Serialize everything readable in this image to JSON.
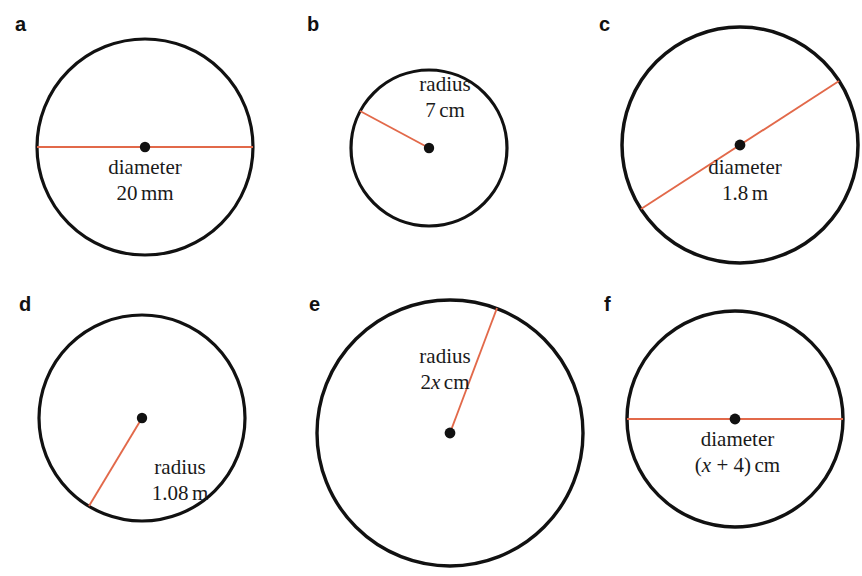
{
  "figure": {
    "background_color": "#ffffff",
    "outline_color": "#111111",
    "measure_line_color": "#e2694a",
    "center_dot_color": "#111111",
    "width": 862,
    "height": 576
  },
  "panels": [
    {
      "label": "a",
      "measure_type": "diameter",
      "term": "diameter",
      "value_prefix": "20",
      "value_unit": "mm",
      "value_full": "20 mm",
      "center": {
        "x": 145,
        "y": 147
      },
      "radius_px": 108,
      "line_angle_deg": 0
    },
    {
      "label": "b",
      "measure_type": "radius",
      "term": "radius",
      "value_prefix": "7",
      "value_unit": "cm",
      "value_full": "7 cm",
      "center": {
        "x": 429,
        "y": 148
      },
      "radius_px": 78,
      "line_angle_deg": 208
    },
    {
      "label": "c",
      "measure_type": "diameter",
      "term": "diameter",
      "value_prefix": "1.8",
      "value_unit": "m",
      "value_full": "1.8 m",
      "center": {
        "x": 740,
        "y": 145
      },
      "radius_px": 118,
      "line_angle_deg": 327
    },
    {
      "label": "d",
      "measure_type": "radius",
      "term": "radius",
      "value_prefix": "1.08",
      "value_unit": "m",
      "value_full": "1.08 m",
      "center": {
        "x": 142,
        "y": 418
      },
      "radius_px": 103,
      "line_angle_deg": 120
    },
    {
      "label": "e",
      "measure_type": "radius",
      "term": "radius",
      "value_prefix": "2",
      "value_var": "x",
      "value_unit": "cm",
      "value_full": "2x cm",
      "center": {
        "x": 450,
        "y": 433
      },
      "radius_px": 133,
      "line_angle_deg": 290
    },
    {
      "label": "f",
      "measure_type": "diameter",
      "term": "diameter",
      "value_open": "(",
      "value_var": "x",
      "value_op": " + 4",
      "value_close": ")",
      "value_unit": "cm",
      "value_full": "(x + 4) cm",
      "center": {
        "x": 735,
        "y": 419
      },
      "radius_px": 108,
      "line_angle_deg": 0
    }
  ]
}
